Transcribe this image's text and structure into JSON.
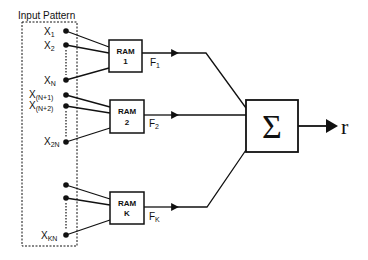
{
  "title": "Input Pattern",
  "inputs": {
    "group1": [
      {
        "name": "X",
        "sub": "1"
      },
      {
        "name": "X",
        "sub": "2"
      },
      {
        "name": "X",
        "sub": "N"
      }
    ],
    "group2": [
      {
        "name": "X",
        "sub": "(N+1)"
      },
      {
        "name": "X",
        "sub": "(N+2)"
      },
      {
        "name": "X",
        "sub": "2N"
      }
    ],
    "groupK": [
      {
        "name": "",
        "sub": ""
      },
      {
        "name": "",
        "sub": ""
      },
      {
        "name": "X",
        "sub": "KN"
      }
    ]
  },
  "rams": [
    {
      "line1": "RAM",
      "line2": "1",
      "output": "F",
      "output_sub": "1"
    },
    {
      "line1": "RAM",
      "line2": "2",
      "output": "F",
      "output_sub": "2"
    },
    {
      "line1": "RAM",
      "line2": "K",
      "output": "F",
      "output_sub": "K"
    }
  ],
  "summer": {
    "symbol": "Σ"
  },
  "output": {
    "label": "r"
  },
  "colors": {
    "stroke": "#111111",
    "background": "#ffffff"
  }
}
